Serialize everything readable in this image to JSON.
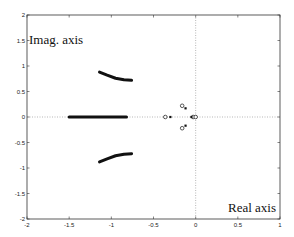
{
  "chart_data": {
    "type": "scatter",
    "title": "",
    "xlabel": "Real axis",
    "ylabel": "Imag. axis",
    "xlim": [
      -2,
      1
    ],
    "ylim": [
      -2,
      2
    ],
    "xticks": [
      "-2",
      "-1.5",
      "-1",
      "-0.5",
      "0",
      "0.5",
      "1"
    ],
    "yticks": [
      "2",
      "1.5",
      "1",
      "0.5",
      "0",
      "-0.5",
      "-1",
      "-1.5",
      "-2"
    ],
    "grid": false,
    "zero_lines": true,
    "series": [
      {
        "name": "root-locus-real-segment",
        "style": "thick-line",
        "points": [
          [
            -1.5,
            0
          ],
          [
            -0.82,
            0
          ]
        ]
      },
      {
        "name": "root-locus-upper-branch",
        "style": "thick-line",
        "points": [
          [
            -1.14,
            0.88
          ],
          [
            -1.05,
            0.82
          ],
          [
            -0.95,
            0.76
          ],
          [
            -0.85,
            0.73
          ],
          [
            -0.76,
            0.72
          ]
        ]
      },
      {
        "name": "root-locus-lower-branch",
        "style": "thick-line",
        "points": [
          [
            -1.14,
            -0.88
          ],
          [
            -1.05,
            -0.82
          ],
          [
            -0.95,
            -0.76
          ],
          [
            -0.85,
            -0.73
          ],
          [
            -0.76,
            -0.72
          ]
        ]
      },
      {
        "name": "zeros",
        "style": "circle",
        "points": [
          [
            -0.36,
            0
          ],
          [
            -0.16,
            0.22
          ],
          [
            -0.16,
            -0.22
          ],
          [
            -0.03,
            0
          ],
          [
            0.0,
            0
          ]
        ]
      },
      {
        "name": "poles",
        "style": "x",
        "points": [
          [
            -0.3,
            0
          ],
          [
            -0.12,
            0.17
          ],
          [
            -0.12,
            -0.17
          ],
          [
            -0.05,
            0
          ]
        ]
      }
    ]
  }
}
